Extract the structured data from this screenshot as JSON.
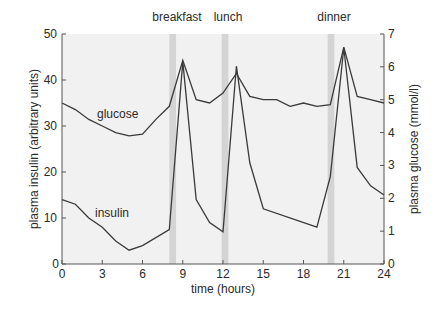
{
  "chart_data": {
    "type": "line",
    "title": "",
    "xlabel": "time (hours)",
    "ylabel": "plasma insulin (arbitrary units)",
    "ylabel_right": "plasma glucose (mmol/l)",
    "xlim": [
      0,
      24
    ],
    "ylim": [
      0,
      50
    ],
    "ylim_right": [
      0,
      7
    ],
    "x_ticks": [
      0,
      3,
      6,
      9,
      12,
      15,
      18,
      21,
      24
    ],
    "y_ticks": [
      0,
      10,
      20,
      30,
      40,
      50
    ],
    "y_ticks_right": [
      0,
      1,
      2,
      3,
      4,
      5,
      6,
      7
    ],
    "grid": false,
    "legend": "inline labels",
    "meals": [
      {
        "label": "breakfast",
        "start": 8.0,
        "end": 8.5
      },
      {
        "label": "lunch",
        "start": 11.9,
        "end": 12.4
      },
      {
        "label": "dinner",
        "start": 19.8,
        "end": 20.3
      }
    ],
    "series": [
      {
        "name": "glucose",
        "axis": "right",
        "unit": "mmol/l",
        "x": [
          0,
          1,
          2,
          3,
          4,
          5,
          6,
          7,
          8,
          9,
          10,
          11,
          12,
          13,
          14,
          15,
          16,
          17,
          18,
          19,
          20,
          21,
          22,
          23,
          24
        ],
        "values": [
          4.9,
          4.7,
          4.4,
          4.2,
          4.0,
          3.9,
          3.95,
          4.4,
          4.8,
          6.2,
          5.0,
          4.9,
          5.2,
          5.8,
          5.1,
          5.0,
          5.0,
          4.8,
          4.9,
          4.8,
          4.85,
          6.6,
          5.1,
          5.0,
          4.9
        ]
      },
      {
        "name": "insulin",
        "axis": "left",
        "unit": "arbitrary units",
        "x": [
          0,
          1,
          2,
          3,
          4,
          5,
          6,
          8,
          9,
          10,
          11,
          12,
          13,
          14,
          15,
          19,
          20,
          21,
          22,
          23,
          24
        ],
        "values": [
          14,
          13,
          10,
          8,
          5,
          3,
          4,
          7.5,
          44,
          14,
          9,
          7,
          43,
          22,
          12,
          8,
          19,
          47,
          21,
          17,
          15
        ]
      }
    ],
    "annotations": [
      {
        "text": "glucose",
        "x": 3.9,
        "y_left": 32
      },
      {
        "text": "insulin",
        "x": 3.3,
        "y_left": 10.5
      }
    ]
  },
  "labels": {
    "glucose": "glucose",
    "insulin": "insulin",
    "breakfast": "breakfast",
    "lunch": "lunch",
    "dinner": "dinner",
    "xlabel": "time (hours)",
    "ylabel_left": "plasma insulin (arbitrary units)",
    "ylabel_right": "plasma glucose (mmol/l)"
  },
  "colors": {
    "plot_bg": "#f1f1f1",
    "meal_band": "#d4d4d4",
    "line": "#3a3a3a",
    "axis": "#555555"
  }
}
